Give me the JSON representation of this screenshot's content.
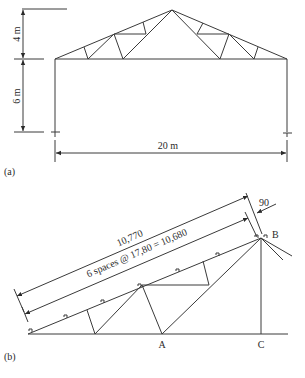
{
  "figure_a": {
    "label": "(a)",
    "dim_top_height": "4 m",
    "dim_column_height": "6 m",
    "dim_span": "20 m"
  },
  "figure_b": {
    "label": "(b)",
    "dim_total": "10,770",
    "dim_spaces": "6 spaces @ 17,80 = 10,680",
    "dim_offset": "90",
    "node_a": "A",
    "node_b": "B",
    "node_c": "C"
  },
  "colors": {
    "line": "#3a3a3a",
    "text": "#2a2a2a",
    "background": "#ffffff"
  }
}
